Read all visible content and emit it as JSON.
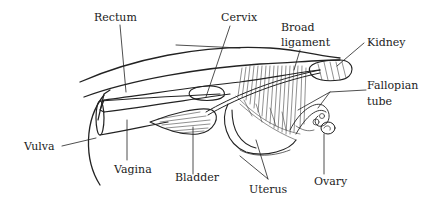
{
  "diagram": {
    "line_color": "#222222",
    "background": "#ffffff",
    "labels": {
      "rectum": "Rectum",
      "cervix": "Cervix",
      "broad_ligament_line1": "Broad",
      "broad_ligament_line2": "ligament",
      "kidney": "Kidney",
      "fallopian_tube_line1": "Fallopian",
      "fallopian_tube_line2": "tube",
      "vulva": "Vulva",
      "vagina": "Vagina",
      "bladder": "Bladder",
      "uterus": "Uterus",
      "ovary": "Ovary"
    }
  }
}
